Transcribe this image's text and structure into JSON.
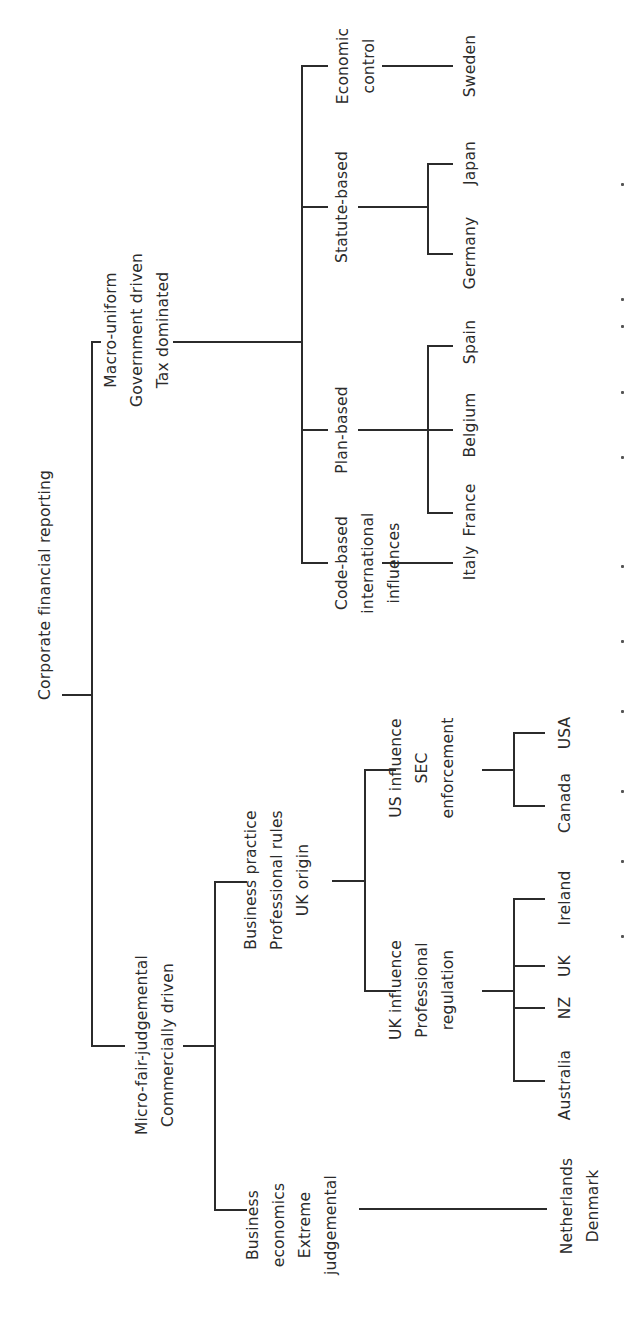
{
  "diagram": {
    "orientation": "rotated-90-ccw",
    "root": {
      "label": "Corporate financial reporting"
    },
    "macro": {
      "lines": [
        "Macro-uniform",
        "Government driven",
        "Tax dominated"
      ],
      "children": [
        {
          "lines": [
            "Economic",
            "control"
          ],
          "countries": [
            "Sweden"
          ]
        },
        {
          "lines": [
            "Statute-based"
          ],
          "countries": [
            "Germany",
            "Japan"
          ]
        },
        {
          "lines": [
            "Plan-based"
          ],
          "countries": [
            "France",
            "Belgium",
            "Spain"
          ]
        },
        {
          "lines": [
            "Code-based",
            "international",
            "influences"
          ],
          "countries": [
            "Italy"
          ]
        }
      ]
    },
    "micro": {
      "lines": [
        "Micro-fair-judgemental",
        "Commercially driven"
      ],
      "business_practice": {
        "lines": [
          "Business practice",
          "Professional rules",
          "UK origin"
        ],
        "us": {
          "lines": [
            "US influence",
            "SEC",
            "enforcement"
          ],
          "countries": [
            "Canada",
            "USA"
          ]
        },
        "uk": {
          "lines": [
            "UK influence",
            "Professional",
            "regulation"
          ],
          "countries": [
            "Australia",
            "NZ",
            "UK",
            "Ireland"
          ]
        }
      },
      "business_economics": {
        "lines": [
          "Business",
          "economics",
          "Extreme",
          "judgemental"
        ],
        "countries": [
          "Netherlands",
          "Denmark"
        ]
      }
    }
  }
}
